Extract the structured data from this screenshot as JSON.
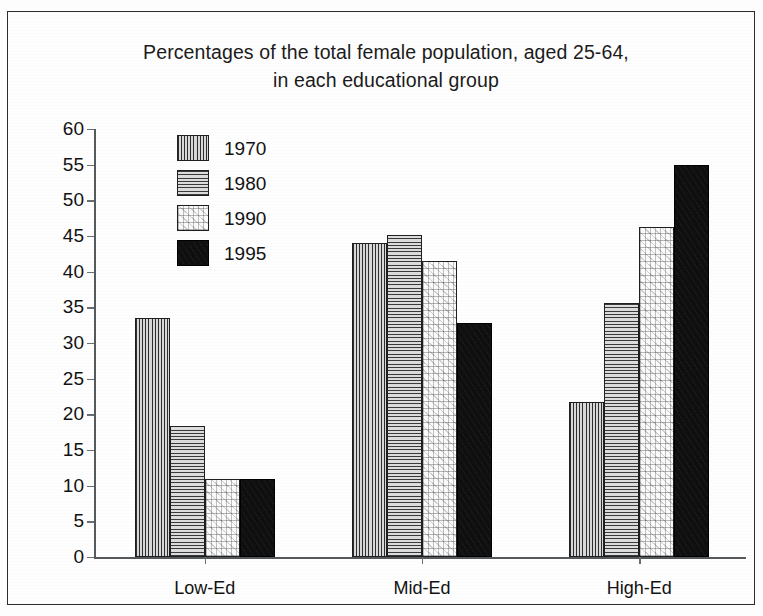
{
  "chart_data": {
    "type": "bar",
    "title": "Percentages of the total female population, aged 25-64, in each educational group",
    "title_line1": "Percentages of the total female population, aged 25-64,",
    "title_line2": "in each educational group",
    "xlabel": "",
    "ylabel": "",
    "ylim": [
      0,
      60
    ],
    "ytick_step": 5,
    "grid": false,
    "legend_position": "upper-left-inside",
    "categories": [
      "Low-Ed",
      "Mid-Ed",
      "High-Ed"
    ],
    "ytick_labels": [
      "60",
      "55",
      "50",
      "45",
      "40",
      "35",
      "30",
      "25",
      "20",
      "15",
      "10",
      "5",
      "0"
    ],
    "ytick_values": [
      60,
      55,
      50,
      45,
      40,
      35,
      30,
      25,
      20,
      15,
      10,
      5,
      0
    ],
    "series": [
      {
        "name": "1970",
        "pattern": "vertical-lines",
        "values": [
          33.5,
          44.0,
          21.7
        ]
      },
      {
        "name": "1980",
        "pattern": "horizontal-lines",
        "values": [
          18.3,
          45.2,
          35.6
        ]
      },
      {
        "name": "1990",
        "pattern": "speckle-light",
        "values": [
          11.0,
          41.5,
          46.2
        ]
      },
      {
        "name": "1995",
        "pattern": "solid-black",
        "values": [
          11.0,
          32.8,
          55.0
        ]
      }
    ],
    "legend": [
      "1970",
      "1980",
      "1990",
      "1995"
    ]
  },
  "colors": {
    "axis": "#55595b",
    "text": "#121212",
    "frame": "#2b2b2b",
    "background": "#fefefe",
    "series_1995": "#100f0f"
  }
}
